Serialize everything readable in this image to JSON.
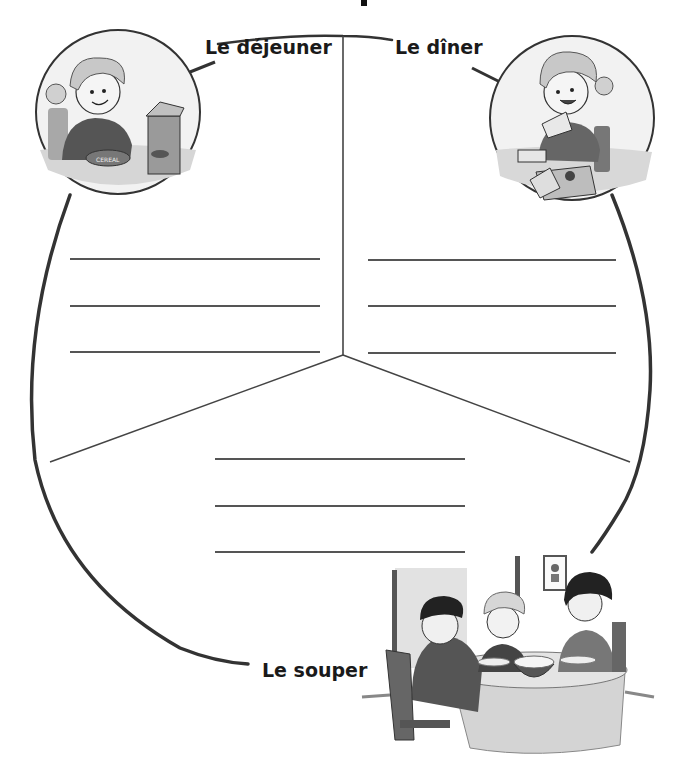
{
  "worksheet": {
    "title_fragment": "p",
    "sections": [
      {
        "id": "breakfast",
        "label": "Le déjeuner",
        "illustration": "child-eating-cereal",
        "illustration_text": "CEREAL",
        "line_count": 3
      },
      {
        "id": "lunch",
        "label": "Le dîner",
        "illustration": "child-eating-sandwich",
        "line_count": 3
      },
      {
        "id": "supper",
        "label": "Le souper",
        "illustration": "family-eating-at-table",
        "line_count": 3
      }
    ],
    "colors": {
      "outline": "#333333",
      "writing_line": "#555555",
      "label_text": "#1a1a1a",
      "illustration_fill": "#d8d8d8",
      "illustration_dark": "#555555"
    }
  }
}
